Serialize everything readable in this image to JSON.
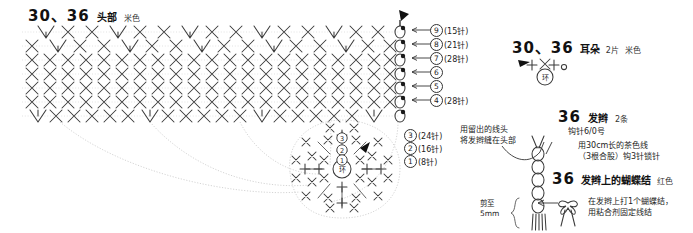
{
  "head_section": {
    "title_number": "30、36",
    "title_part": "头部",
    "title_color": "米色",
    "chart_symbols_note": "X = 短针, ∧ = 2针并1针, ∨ = 1针放2针, 环 = 环形起针",
    "row_labels": [
      {
        "num": "9",
        "count": "(15针)"
      },
      {
        "num": "8",
        "count": "(21针)"
      },
      {
        "num": "7",
        "count": "(28针)"
      },
      {
        "num": "6",
        "count": ""
      },
      {
        "num": "5",
        "count": ""
      },
      {
        "num": "4",
        "count": "(28针)"
      }
    ],
    "lower_row_labels": [
      {
        "num": "3",
        "count": "(24针)"
      },
      {
        "num": "2",
        "count": "(16针)"
      },
      {
        "num": "1",
        "count": "(8针)"
      }
    ],
    "ring_label": "环"
  },
  "ear_section": {
    "title_number": "30、36",
    "title_part": "耳朵",
    "title_qty": "2片",
    "title_color": "米色",
    "ring_label": "环"
  },
  "braid_section": {
    "title_number": "36",
    "title_part": "发辫",
    "title_qty": "2条",
    "hook_note": "钩针6/0号",
    "material_note_line1": "用30cm长的茶色线",
    "material_note_line2": "（3根合股）钩3针锁针",
    "attach_note_line1": "用留出的线头",
    "attach_note_line2": "将发辫缝在头部"
  },
  "bow_section": {
    "title_number": "36",
    "title_part": "发辫上的蝴蝶结",
    "title_color": "红色",
    "instruction_line1": "在发辫上打1个蝴蝶结，",
    "instruction_line2": "用粘合剂固定线结",
    "trim_label_line1": "剪至",
    "trim_label_line2": "5mm"
  },
  "colors": {
    "ink": "#1a1a1a",
    "stitch": "#3a3a3a",
    "guide": "#c9c9c9",
    "background": "#ffffff"
  }
}
